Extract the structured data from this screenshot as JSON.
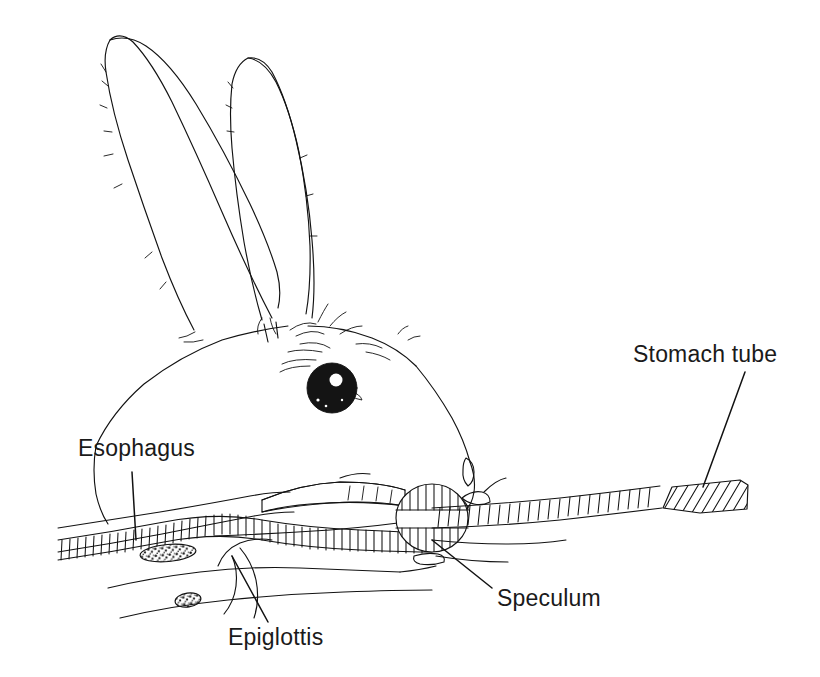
{
  "figure": {
    "background_color": "#ffffff",
    "ink_color": "#121212",
    "width": 820,
    "height": 677
  },
  "labels": [
    {
      "id": "esophagus",
      "text": "Esophagus",
      "x": 78,
      "y": 456,
      "anchor": "start",
      "leader": {
        "x1": 132,
        "y1": 472,
        "x2": 136,
        "y2": 540
      }
    },
    {
      "id": "stomach-tube",
      "text": "Stomach  tube",
      "x": 633,
      "y": 362,
      "anchor": "start",
      "leader": {
        "x1": 745,
        "y1": 372,
        "x2": 703,
        "y2": 487
      }
    },
    {
      "id": "speculum",
      "text": "Speculum",
      "x": 497,
      "y": 606,
      "anchor": "start",
      "leader": {
        "x1": 492,
        "y1": 588,
        "x2": 432,
        "y2": 540
      }
    },
    {
      "id": "epiglottis",
      "text": "Epiglottis",
      "x": 228,
      "y": 645,
      "anchor": "start",
      "leader": {
        "x1": 268,
        "y1": 622,
        "x2": 232,
        "y2": 556
      }
    }
  ],
  "anatomy_parts": [
    {
      "id": "ear-left",
      "name": "Left ear"
    },
    {
      "id": "ear-right",
      "name": "Right ear"
    },
    {
      "id": "head-outline",
      "name": "Head outline"
    },
    {
      "id": "eye",
      "name": "Eye"
    },
    {
      "id": "nose",
      "name": "Nose and nostril"
    },
    {
      "id": "esophagus-tract",
      "name": "Esophagus"
    },
    {
      "id": "trachea",
      "name": "Trachea with cartilage rings"
    },
    {
      "id": "epiglottis-flap",
      "name": "Epiglottis"
    },
    {
      "id": "soft-palate",
      "name": "Soft palate / tongue"
    },
    {
      "id": "speculum-disc",
      "name": "Speculum"
    },
    {
      "id": "stomach-tube-shaft",
      "name": "Stomach tube shaft"
    },
    {
      "id": "stomach-tube-end",
      "name": "Stomach tube flared end"
    },
    {
      "id": "gland-upper",
      "name": "Upper gland"
    },
    {
      "id": "gland-lower",
      "name": "Lower gland"
    }
  ]
}
